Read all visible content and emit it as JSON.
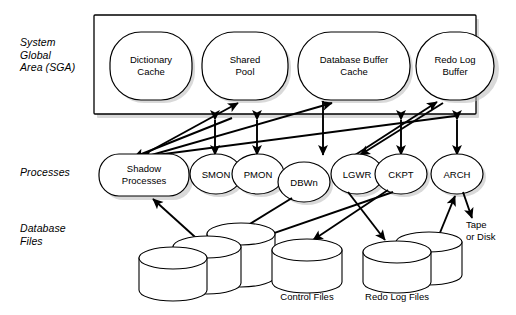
{
  "diagram": {
    "row_labels": [
      {
        "id": "sga",
        "text": "System\nGlobal\nArea (SGA)"
      },
      {
        "id": "processes",
        "text": "Processes"
      },
      {
        "id": "database-files",
        "text": "Database\nFiles"
      }
    ],
    "sga": {
      "nodes": [
        {
          "id": "dictionary-cache",
          "line1": "Dictionary",
          "line2": "Cache"
        },
        {
          "id": "shared-pool",
          "line1": "Shared",
          "line2": "Pool"
        },
        {
          "id": "database-buffer-cache",
          "line1": "Database Buffer",
          "line2": "Cache"
        },
        {
          "id": "redo-log-buffer",
          "line1": "Redo Log",
          "line2": "Buffer"
        }
      ]
    },
    "processes": {
      "nodes": [
        {
          "id": "shadow-processes",
          "line1": "Shadow",
          "line2": "Processes"
        },
        {
          "id": "smon",
          "line1": "SMON",
          "line2": ""
        },
        {
          "id": "pmon",
          "line1": "PMON",
          "line2": ""
        },
        {
          "id": "dbwn",
          "line1": "DBWn",
          "line2": ""
        },
        {
          "id": "lgwr",
          "line1": "LGWR",
          "line2": ""
        },
        {
          "id": "ckpt",
          "line1": "CKPT",
          "line2": ""
        },
        {
          "id": "arch",
          "line1": "ARCH",
          "line2": ""
        }
      ]
    },
    "storage": {
      "captions": [
        {
          "id": "control-files",
          "text": "Control Files"
        },
        {
          "id": "redo-log-files",
          "text": "Redo Log Files"
        }
      ],
      "tape_or_disk": {
        "line1": "Tape",
        "line2": "or Disk"
      }
    },
    "colors": {
      "stroke": "#000000",
      "fill": "#ffffff",
      "shadow": "#b9b9b9",
      "background": "#ffffff"
    }
  }
}
